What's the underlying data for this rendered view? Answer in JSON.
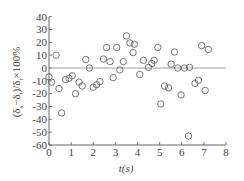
{
  "chart_data": {
    "type": "scatter",
    "title": "",
    "xlabel": "t(s)",
    "ylabel": "(δs−δt)/δt×100%",
    "ylabel_parts": {
      "open": "(δ",
      "sub1": "s",
      "minus": "−δ",
      "sub2": "t",
      "mid": ")/δ",
      "sub3": "t",
      "tail": "×100%"
    },
    "xlim": [
      0,
      8
    ],
    "ylim": [
      -60,
      40
    ],
    "xticks": [
      0,
      1,
      2,
      3,
      4,
      5,
      6,
      7,
      8
    ],
    "yticks": [
      40,
      30,
      20,
      10,
      0,
      -10,
      -20,
      -30,
      -40,
      -50,
      -60
    ],
    "grid": false,
    "legend": null,
    "reference_line": {
      "y": 0,
      "x_start": 0,
      "x_end": 8
    },
    "marker": "open-circle",
    "series": [
      {
        "name": "relative error",
        "points": [
          {
            "x": 0.0,
            "y": -7
          },
          {
            "x": 0.12,
            "y": -11
          },
          {
            "x": 0.32,
            "y": 10
          },
          {
            "x": 0.45,
            "y": -16
          },
          {
            "x": 0.57,
            "y": -35
          },
          {
            "x": 0.75,
            "y": -9
          },
          {
            "x": 0.9,
            "y": -8
          },
          {
            "x": 1.05,
            "y": -6
          },
          {
            "x": 1.2,
            "y": -20
          },
          {
            "x": 1.36,
            "y": -11
          },
          {
            "x": 1.5,
            "y": -14
          },
          {
            "x": 1.66,
            "y": 6.6
          },
          {
            "x": 1.82,
            "y": 0
          },
          {
            "x": 2.0,
            "y": -15
          },
          {
            "x": 2.15,
            "y": -13
          },
          {
            "x": 2.3,
            "y": -10.5
          },
          {
            "x": 2.46,
            "y": 7
          },
          {
            "x": 2.6,
            "y": 16
          },
          {
            "x": 2.76,
            "y": 5
          },
          {
            "x": 2.9,
            "y": -7.5
          },
          {
            "x": 3.06,
            "y": 16
          },
          {
            "x": 3.2,
            "y": -1.5
          },
          {
            "x": 3.36,
            "y": 5
          },
          {
            "x": 3.5,
            "y": 25
          },
          {
            "x": 3.66,
            "y": 19.5
          },
          {
            "x": 3.8,
            "y": 12
          },
          {
            "x": 3.86,
            "y": 18.5
          },
          {
            "x": 4.1,
            "y": -5
          },
          {
            "x": 4.27,
            "y": 6
          },
          {
            "x": 4.5,
            "y": 0.5
          },
          {
            "x": 4.65,
            "y": 3.5
          },
          {
            "x": 4.75,
            "y": 6
          },
          {
            "x": 4.92,
            "y": 16
          },
          {
            "x": 5.05,
            "y": -28
          },
          {
            "x": 5.22,
            "y": -14
          },
          {
            "x": 5.4,
            "y": -15.5
          },
          {
            "x": 5.52,
            "y": 3
          },
          {
            "x": 5.67,
            "y": 12.5
          },
          {
            "x": 5.82,
            "y": 0
          },
          {
            "x": 5.97,
            "y": -21
          },
          {
            "x": 6.12,
            "y": 0
          },
          {
            "x": 6.3,
            "y": -53
          },
          {
            "x": 6.35,
            "y": 0.5
          },
          {
            "x": 6.6,
            "y": -12
          },
          {
            "x": 6.76,
            "y": -9.5
          },
          {
            "x": 6.9,
            "y": 17.5
          },
          {
            "x": 7.06,
            "y": -17.5
          },
          {
            "x": 7.2,
            "y": 14.5
          }
        ]
      }
    ],
    "colors": {
      "axis": "#555555",
      "marker_stroke": "#555555",
      "zero_line": "#777777",
      "text": "#444444"
    }
  },
  "layout": {
    "plot_left": 49,
    "plot_right": 226,
    "plot_top": 16.7,
    "plot_bottom": 145,
    "marker_radius": 3.2
  }
}
